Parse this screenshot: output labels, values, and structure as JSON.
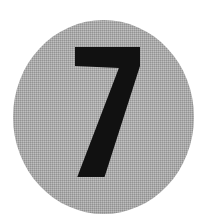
{
  "canvas": {
    "width": 208,
    "height": 219,
    "background_color": "#ffffff"
  },
  "badge": {
    "shape": "circle",
    "label": "7",
    "aria_label": "Number 7 badge",
    "fill_color": "#a9a9a9",
    "numeral_color": "#111111",
    "texture": "halftone-dither",
    "center_x": 103,
    "center_y": 110,
    "diameter": 181,
    "numeral": {
      "value": "7",
      "bbox_x": 75,
      "bbox_y": 47,
      "bbox_width": 65,
      "bbox_height": 130,
      "style": "bold-sans-serif"
    }
  },
  "icons": {
    "circle_badge": "circle-badge-icon",
    "numeral_seven": "numeral-seven-icon"
  }
}
